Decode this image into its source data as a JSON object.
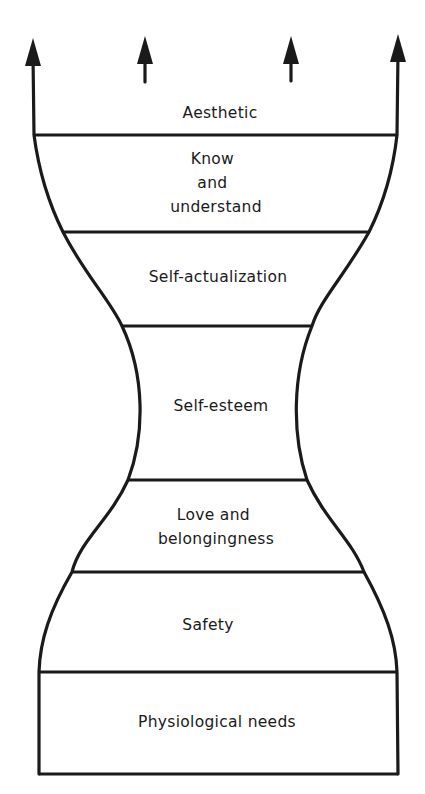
{
  "diagram": {
    "type": "hierarchy-of-needs-hourglass",
    "levels": [
      {
        "label_lines": [
          "Aesthetic"
        ]
      },
      {
        "label_lines": [
          "Know",
          "and",
          "understand"
        ]
      },
      {
        "label_lines": [
          "Self-actualization"
        ]
      },
      {
        "label_lines": [
          "Self-esteem"
        ]
      },
      {
        "label_lines": [
          "Love and",
          "belongingness"
        ]
      },
      {
        "label_lines": [
          "Safety"
        ]
      },
      {
        "label_lines": [
          "Physiological needs"
        ]
      }
    ],
    "arrows": {
      "count": 4,
      "direction": "up"
    },
    "colors": {
      "ink": "#1a1a1a",
      "background": "#ffffff"
    }
  }
}
